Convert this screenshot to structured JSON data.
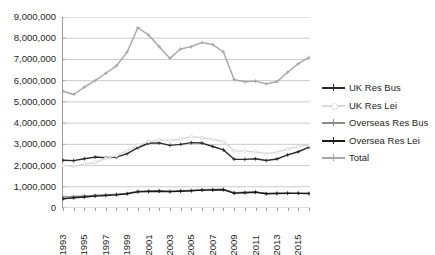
{
  "chart_data": {
    "type": "line",
    "title": "",
    "subtitle": "",
    "xlabel": "",
    "ylabel": "",
    "grid": true,
    "legend_position": "right",
    "xlim": [
      1993,
      2016
    ],
    "ylim": [
      0,
      9000000
    ],
    "ytick_values": [
      0,
      1000000,
      2000000,
      3000000,
      4000000,
      5000000,
      6000000,
      7000000,
      8000000,
      9000000
    ],
    "ytick_labels": [
      "0",
      "1,000,000",
      "2,000,000",
      "3,000,000",
      "4,000,000",
      "5,000,000",
      "6,000,000",
      "7,000,000",
      "8,000,000",
      "9,000,000"
    ],
    "x": [
      1993,
      1994,
      1995,
      1996,
      1997,
      1998,
      1999,
      2000,
      2001,
      2002,
      2003,
      2004,
      2005,
      2006,
      2007,
      2008,
      2009,
      2010,
      2011,
      2012,
      2013,
      2014,
      2015,
      2016
    ],
    "xtick_labels": [
      "1993",
      "",
      "1995",
      "",
      "1997",
      "",
      "1999",
      "",
      "2001",
      "",
      "2003",
      "",
      "2005",
      "",
      "2007",
      "",
      "2009",
      "",
      "2011",
      "",
      "2013",
      "",
      "2015",
      ""
    ],
    "xtick_labels_shown": [
      "1993",
      "1995",
      "1997",
      "1999",
      "2001",
      "2003",
      "2005",
      "2007",
      "2009",
      "2011",
      "2013",
      "2015"
    ],
    "series": [
      {
        "name": "UK Res Bus",
        "color": "#2b2b2b",
        "marker": "cross",
        "values": [
          2250000,
          2230000,
          2320000,
          2400000,
          2370000,
          2400000,
          2560000,
          2840000,
          3050000,
          3070000,
          2950000,
          3000000,
          3080000,
          3060000,
          2900000,
          2740000,
          2300000,
          2290000,
          2320000,
          2240000,
          2310000,
          2500000,
          2650000,
          2870000
        ]
      },
      {
        "name": "UK Res Lei",
        "color": "#d9d9d9",
        "marker": "circle",
        "values": [
          2010000,
          1970000,
          2070000,
          2150000,
          2330000,
          2470000,
          2700000,
          2950000,
          3130000,
          3200000,
          3180000,
          3250000,
          3370000,
          3310000,
          3240000,
          3130000,
          2700000,
          2680000,
          2640000,
          2560000,
          2630000,
          2780000,
          2890000,
          2960000
        ]
      },
      {
        "name": "Overseas Res Bus",
        "color": "#8c8c8c",
        "marker": "cross",
        "values": [
          520000,
          540000,
          570000,
          600000,
          620000,
          650000,
          690000,
          790000,
          800000,
          810000,
          790000,
          810000,
          830000,
          860000,
          870000,
          880000,
          720000,
          740000,
          760000,
          690000,
          700000,
          710000,
          700000,
          690000
        ]
      },
      {
        "name": "Oversea Res Lei",
        "color": "#1a1a1a",
        "marker": "cross",
        "values": [
          430000,
          480000,
          520000,
          560000,
          590000,
          620000,
          670000,
          760000,
          780000,
          790000,
          770000,
          790000,
          810000,
          840000,
          850000,
          860000,
          700000,
          720000,
          740000,
          670000,
          680000,
          690000,
          690000,
          680000
        ]
      },
      {
        "name": "Total",
        "color": "#a6a6a6",
        "marker": "cross",
        "values": [
          5500000,
          5350000,
          5700000,
          6000000,
          6350000,
          6700000,
          7350000,
          8500000,
          8150000,
          7600000,
          7050000,
          7500000,
          7600000,
          7800000,
          7700000,
          7350000,
          6050000,
          5950000,
          5980000,
          5850000,
          5950000,
          6400000,
          6800000,
          7100000
        ]
      }
    ]
  }
}
